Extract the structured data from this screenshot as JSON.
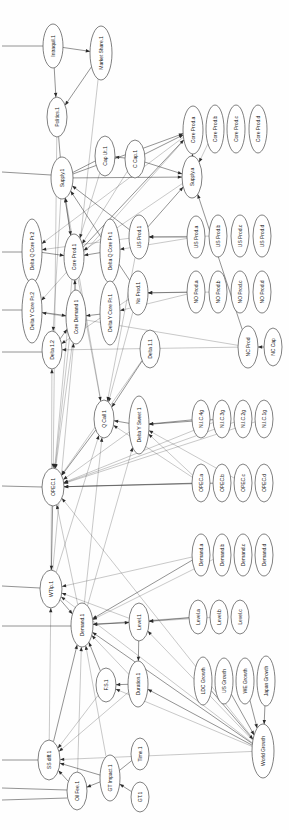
{
  "diagram": {
    "orientation": "rotated-90-ccw",
    "node_shape": "ellipse",
    "colors": {
      "node_fill": "#ffffff",
      "node_stroke": "#4a4a4a",
      "edge": "#3a3a3a",
      "label": "#1a1a1a",
      "background": "#ffffff"
    },
    "nodes": [
      {
        "id": "intraquil1",
        "label": "Intraquil.1",
        "x": 53,
        "y": 46,
        "rx": 10,
        "ry": 22
      },
      {
        "id": "marketshare1",
        "label": "Market Share.1",
        "x": 101,
        "y": 53,
        "rx": 11,
        "ry": 27
      },
      {
        "id": "politics1",
        "label": "Politics.1",
        "x": 57,
        "y": 117,
        "rx": 10,
        "ry": 20
      },
      {
        "id": "caput1",
        "label": "Cap Ut.1",
        "x": 105,
        "y": 156,
        "rx": 10,
        "ry": 20
      },
      {
        "id": "ccap1",
        "label": "C Cap.1",
        "x": 135,
        "y": 159,
        "rx": 10,
        "ry": 19
      },
      {
        "id": "supply1",
        "label": "Supply.1",
        "x": 62,
        "y": 178,
        "rx": 11,
        "ry": 21
      },
      {
        "id": "coreproda",
        "label": "Core Prod.a",
        "x": 193,
        "y": 130,
        "rx": 10,
        "ry": 24
      },
      {
        "id": "coreprodb",
        "label": "Core Prod.b",
        "x": 215,
        "y": 129,
        "rx": 9,
        "ry": 24
      },
      {
        "id": "coreprodc",
        "label": "Core Prod.c",
        "x": 236,
        "y": 129,
        "rx": 9,
        "ry": 24
      },
      {
        "id": "coreprodd",
        "label": "Core Prod.d",
        "x": 258,
        "y": 129,
        "rx": 9,
        "ry": 24
      },
      {
        "id": "supplya",
        "label": "Supply.a",
        "x": 192,
        "y": 177,
        "rx": 10,
        "ry": 21
      },
      {
        "id": "deltaqcorepr2",
        "label": "Delta Q Core Pr.2",
        "x": 32,
        "y": 251,
        "rx": 10,
        "ry": 32
      },
      {
        "id": "coreprod1",
        "label": "Core Prod.1",
        "x": 74,
        "y": 257,
        "rx": 10,
        "ry": 23
      },
      {
        "id": "deltaqcorepr1",
        "label": "Delta Q Core Pr.1",
        "x": 110,
        "y": 251,
        "rx": 10,
        "ry": 32
      },
      {
        "id": "usprod1",
        "label": "US Prod.1",
        "x": 139,
        "y": 237,
        "rx": 10,
        "ry": 22
      },
      {
        "id": "usproda",
        "label": "US Prod.a",
        "x": 196,
        "y": 237,
        "rx": 9,
        "ry": 21
      },
      {
        "id": "usprodb",
        "label": "US Prod.b",
        "x": 218,
        "y": 236,
        "rx": 9,
        "ry": 21
      },
      {
        "id": "usprodc",
        "label": "US Prod.c",
        "x": 240,
        "y": 236,
        "rx": 9,
        "ry": 21
      },
      {
        "id": "usprodd",
        "label": "US Prod.d",
        "x": 262,
        "y": 236,
        "rx": 9,
        "ry": 21
      },
      {
        "id": "deltaycorepr2",
        "label": "Delta Y Core Pr.2",
        "x": 32,
        "y": 311,
        "rx": 10,
        "ry": 32
      },
      {
        "id": "coredemand1",
        "label": "Core Demand 1",
        "x": 76,
        "y": 317,
        "rx": 10,
        "ry": 27
      },
      {
        "id": "deltaycorepr1",
        "label": "Delta Y Core Pr.1",
        "x": 110,
        "y": 313,
        "rx": 10,
        "ry": 32
      },
      {
        "id": "noprod1",
        "label": "No Prod.1",
        "x": 138,
        "y": 293,
        "rx": 10,
        "ry": 22
      },
      {
        "id": "noproda",
        "label": "NO Prod.a",
        "x": 196,
        "y": 292,
        "rx": 9,
        "ry": 21
      },
      {
        "id": "noprodb",
        "label": "NO Prod.b",
        "x": 218,
        "y": 292,
        "rx": 9,
        "ry": 21
      },
      {
        "id": "noprodc",
        "label": "NO Prod.c",
        "x": 240,
        "y": 292,
        "rx": 9,
        "ry": 21
      },
      {
        "id": "noprodd",
        "label": "NO Prod.d",
        "x": 262,
        "y": 292,
        "rx": 9,
        "ry": 21
      },
      {
        "id": "ncprod",
        "label": "NC Prod",
        "x": 248,
        "y": 347,
        "rx": 10,
        "ry": 21
      },
      {
        "id": "nccap",
        "label": "NC Cap",
        "x": 273,
        "y": 347,
        "rx": 9,
        "ry": 19
      },
      {
        "id": "delta12",
        "label": "Delta 1.2",
        "x": 52,
        "y": 350,
        "rx": 10,
        "ry": 19
      },
      {
        "id": "delta11",
        "label": "Delta 1.1",
        "x": 150,
        "y": 349,
        "rx": 10,
        "ry": 19
      },
      {
        "id": "qcall1",
        "label": "Q Call 1",
        "x": 104,
        "y": 419,
        "rx": 10,
        "ry": 19
      },
      {
        "id": "deltaysweet1",
        "label": "Delta Y Sweet 1",
        "x": 139,
        "y": 425,
        "rx": 10,
        "ry": 29
      },
      {
        "id": "nic4g",
        "label": "N.I.C.4g",
        "x": 201,
        "y": 419,
        "rx": 9,
        "ry": 19
      },
      {
        "id": "nic3g",
        "label": "N.I.C.3g",
        "x": 222,
        "y": 419,
        "rx": 9,
        "ry": 19
      },
      {
        "id": "nic2g",
        "label": "N.I.C.2g",
        "x": 243,
        "y": 419,
        "rx": 9,
        "ry": 19
      },
      {
        "id": "nic1g",
        "label": "N.I.C.1g",
        "x": 264,
        "y": 419,
        "rx": 9,
        "ry": 19
      },
      {
        "id": "opec1",
        "label": "OPEC.1",
        "x": 53,
        "y": 487,
        "rx": 11,
        "ry": 19
      },
      {
        "id": "opeca",
        "label": "OPEC.a",
        "x": 201,
        "y": 483,
        "rx": 9,
        "ry": 19
      },
      {
        "id": "opecb",
        "label": "OPEC.b",
        "x": 222,
        "y": 483,
        "rx": 9,
        "ry": 19
      },
      {
        "id": "opecc",
        "label": "OPEC.c",
        "x": 243,
        "y": 483,
        "rx": 9,
        "ry": 19
      },
      {
        "id": "opecd",
        "label": "OPEC.d",
        "x": 264,
        "y": 483,
        "rx": 9,
        "ry": 19
      },
      {
        "id": "demanda",
        "label": "Demand.a",
        "x": 201,
        "y": 555,
        "rx": 9,
        "ry": 21
      },
      {
        "id": "demandb",
        "label": "Demand.b",
        "x": 222,
        "y": 555,
        "rx": 9,
        "ry": 21
      },
      {
        "id": "demandc",
        "label": "Demand.c",
        "x": 243,
        "y": 555,
        "rx": 9,
        "ry": 21
      },
      {
        "id": "demandd",
        "label": "Demand.d",
        "x": 264,
        "y": 555,
        "rx": 9,
        "ry": 21
      },
      {
        "id": "wtip1",
        "label": "WTIp.1",
        "x": 51,
        "y": 589,
        "rx": 11,
        "ry": 19
      },
      {
        "id": "demand1",
        "label": "Demand.1",
        "x": 82,
        "y": 625,
        "rx": 11,
        "ry": 22
      },
      {
        "id": "level1",
        "label": "Level.1",
        "x": 139,
        "y": 622,
        "rx": 10,
        "ry": 19
      },
      {
        "id": "levela",
        "label": "Level.a",
        "x": 198,
        "y": 617,
        "rx": 9,
        "ry": 17
      },
      {
        "id": "levelb",
        "label": "Level.b",
        "x": 219,
        "y": 617,
        "rx": 9,
        "ry": 17
      },
      {
        "id": "levelc",
        "label": "Level.c",
        "x": 240,
        "y": 617,
        "rx": 9,
        "ry": 17
      },
      {
        "id": "fs1",
        "label": "F.S.1",
        "x": 106,
        "y": 685,
        "rx": 10,
        "ry": 17
      },
      {
        "id": "duration1",
        "label": "Duration.1",
        "x": 138,
        "y": 684,
        "rx": 10,
        "ry": 23
      },
      {
        "id": "ldcgrowth",
        "label": "LDC Growth",
        "x": 203,
        "y": 681,
        "rx": 9,
        "ry": 24
      },
      {
        "id": "usgrowth",
        "label": "US Growth",
        "x": 224,
        "y": 681,
        "rx": 9,
        "ry": 23
      },
      {
        "id": "wegrowth",
        "label": "WE Growth",
        "x": 245,
        "y": 681,
        "rx": 9,
        "ry": 23
      },
      {
        "id": "japangrowth",
        "label": "Japan Growth",
        "x": 266,
        "y": 681,
        "rx": 9,
        "ry": 25
      },
      {
        "id": "worldgrowth",
        "label": "World Growth",
        "x": 263,
        "y": 751,
        "rx": 11,
        "ry": 27
      },
      {
        "id": "ssdiff1",
        "label": "SS diff.1",
        "x": 49,
        "y": 760,
        "rx": 11,
        "ry": 20
      },
      {
        "id": "oilfee1",
        "label": "Oil Fee.1",
        "x": 77,
        "y": 791,
        "rx": 10,
        "ry": 19
      },
      {
        "id": "gtimpact1",
        "label": "GT Impact.1",
        "x": 110,
        "y": 778,
        "rx": 10,
        "ry": 23
      },
      {
        "id": "gt1",
        "label": "GT.1",
        "x": 140,
        "y": 797,
        "rx": 9,
        "ry": 15
      },
      {
        "id": "time1",
        "label": "Time.1",
        "x": 140,
        "y": 754,
        "rx": 9,
        "ry": 16
      }
    ],
    "edges": [
      {
        "from": "intraquil1",
        "to": "marketshare1",
        "arrow": true
      },
      {
        "from": "intraquil1",
        "to": "politics1",
        "arrow": true
      },
      {
        "from": "marketshare1",
        "to": "politics1",
        "arrow": true
      },
      {
        "from": "politics1",
        "to": "supply1",
        "arrow": false
      },
      {
        "from": "ccap1",
        "to": "caput1",
        "arrow": true
      },
      {
        "from": "caput1",
        "to": "supply1",
        "arrow": false
      },
      {
        "from": "supply1",
        "to": "coreproda",
        "arrow": true
      },
      {
        "from": "supply1",
        "to": "supplya",
        "arrow": true
      },
      {
        "from": "ccap1",
        "to": "coreproda",
        "arrow": true
      },
      {
        "from": "ccap1",
        "to": "supplya",
        "arrow": true
      },
      {
        "from": "supplya",
        "to": "coreproda",
        "arrow": true
      },
      {
        "from": "coreprod1",
        "to": "supply1",
        "arrow": true
      },
      {
        "from": "coreprod1",
        "to": "coreproda",
        "arrow": true
      },
      {
        "from": "usprod1",
        "to": "supply1",
        "arrow": true
      },
      {
        "from": "usprod1",
        "to": "supplya",
        "arrow": true
      },
      {
        "from": "usproda",
        "to": "usprod1",
        "arrow": true
      },
      {
        "from": "noprod1",
        "to": "supply1",
        "arrow": true
      },
      {
        "from": "noproda",
        "to": "noprod1",
        "arrow": true
      },
      {
        "from": "ncprod",
        "to": "supplya",
        "arrow": true
      },
      {
        "from": "nccap",
        "to": "ncprod",
        "arrow": true
      },
      {
        "from": "deltaqcorepr2",
        "to": "coreprod1",
        "arrow": true
      },
      {
        "from": "deltaqcorepr1",
        "to": "coreprod1",
        "arrow": true
      },
      {
        "from": "deltaycorepr2",
        "to": "coredemand1",
        "arrow": true
      },
      {
        "from": "deltaycorepr1",
        "to": "coredemand1",
        "arrow": true
      },
      {
        "from": "coredemand1",
        "to": "coreprod1",
        "arrow": true
      },
      {
        "from": "delta12",
        "to": "coredemand1",
        "arrow": true
      },
      {
        "from": "delta11",
        "to": "qcall1",
        "arrow": true
      },
      {
        "from": "qcall1",
        "to": "opec1",
        "arrow": true
      },
      {
        "from": "deltaysweet1",
        "to": "qcall1",
        "arrow": true
      },
      {
        "from": "nic4g",
        "to": "deltaysweet1",
        "arrow": true
      },
      {
        "from": "nic3g",
        "to": "deltaysweet1",
        "arrow": true
      },
      {
        "from": "opeca",
        "to": "opec1",
        "arrow": true
      },
      {
        "from": "opecb",
        "to": "opec1",
        "arrow": true
      },
      {
        "from": "opec1",
        "to": "wtip1",
        "arrow": true
      },
      {
        "from": "wtip1",
        "to": "demand1",
        "arrow": true
      },
      {
        "from": "demanda",
        "to": "demand1",
        "arrow": true
      },
      {
        "from": "demand1",
        "to": "level1",
        "arrow": true
      },
      {
        "from": "levela",
        "to": "level1",
        "arrow": true
      },
      {
        "from": "level1",
        "to": "duration1",
        "arrow": true
      },
      {
        "from": "duration1",
        "to": "fs1",
        "arrow": true
      },
      {
        "from": "fs1",
        "to": "demand1",
        "arrow": true
      },
      {
        "from": "ldcgrowth",
        "to": "worldgrowth",
        "arrow": true
      },
      {
        "from": "usgrowth",
        "to": "worldgrowth",
        "arrow": true
      },
      {
        "from": "wegrowth",
        "to": "worldgrowth",
        "arrow": true
      },
      {
        "from": "japangrowth",
        "to": "worldgrowth",
        "arrow": true
      },
      {
        "from": "worldgrowth",
        "to": "duration1",
        "arrow": true
      },
      {
        "from": "worldgrowth",
        "to": "demand1",
        "arrow": true
      },
      {
        "from": "ssdiff1",
        "to": "demand1",
        "arrow": true
      },
      {
        "from": "gtimpact1",
        "to": "oilfee1",
        "arrow": true
      },
      {
        "from": "gt1",
        "to": "gtimpact1",
        "arrow": true
      },
      {
        "from": "time1",
        "to": "gtimpact1",
        "arrow": false
      },
      {
        "from": "gtimpact1",
        "to": "ssdiff1",
        "arrow": true
      },
      {
        "from": "oilfee1",
        "to": "ssdiff1",
        "arrow": true
      }
    ],
    "long_edges": [
      {
        "from": "coreproda",
        "to": "deltaqcorepr2"
      },
      {
        "from": "coreproda",
        "to": "deltaycorepr2"
      },
      {
        "from": "supplya",
        "to": "coreprod1"
      },
      {
        "from": "usproda",
        "to": "deltaqcorepr1"
      },
      {
        "from": "noproda",
        "to": "deltaycorepr1"
      },
      {
        "from": "ncprod",
        "to": "deltaycorepr2"
      },
      {
        "from": "ncprod",
        "to": "delta12"
      },
      {
        "from": "opeca",
        "to": "deltaysweet1"
      },
      {
        "from": "opeca",
        "to": "qcall1"
      },
      {
        "from": "demanda",
        "to": "wtip1"
      },
      {
        "from": "levela",
        "to": "demand1"
      },
      {
        "from": "worldgrowth",
        "to": "opec1"
      },
      {
        "from": "worldgrowth",
        "to": "level1"
      },
      {
        "from": "worldgrowth",
        "to": "wtip1"
      },
      {
        "from": "worldgrowth",
        "to": "fs1"
      },
      {
        "from": "worldgrowth",
        "to": "ssdiff1"
      },
      {
        "from": "nic1g",
        "to": "opec1"
      },
      {
        "from": "nic2g",
        "to": "opec1"
      },
      {
        "from": "usprod1",
        "to": "deltaqcorepr2"
      },
      {
        "from": "noprod1",
        "to": "delta12"
      },
      {
        "from": "delta11",
        "to": "opec1"
      },
      {
        "from": "qcall1",
        "to": "supply1"
      },
      {
        "from": "coredemand1",
        "to": "opec1"
      },
      {
        "from": "demand1",
        "to": "opec1"
      },
      {
        "from": "level1",
        "to": "wtip1"
      },
      {
        "from": "duration1",
        "to": "demand1"
      },
      {
        "from": "ssdiff1",
        "to": "wtip1"
      },
      {
        "from": "deltaysweet1",
        "to": "opec1"
      },
      {
        "from": "coreprod1",
        "to": "qcall1"
      },
      {
        "from": "coreprod1",
        "to": "opec1"
      },
      {
        "from": "usprod1",
        "to": "qcall1"
      },
      {
        "from": "noprod1",
        "to": "qcall1"
      },
      {
        "from": "caput1",
        "to": "coreprod1"
      },
      {
        "from": "ccap1",
        "to": "coreprod1"
      },
      {
        "from": "supply1",
        "to": "delta12"
      },
      {
        "from": "supply1",
        "to": "coreprod1"
      },
      {
        "from": "politics1",
        "to": "opec1"
      },
      {
        "from": "marketshare1",
        "to": "opec1"
      },
      {
        "from": "demand1",
        "to": "qcall1"
      },
      {
        "from": "demand1",
        "to": "deltaysweet1"
      },
      {
        "from": "wtip1",
        "to": "coredemand1"
      },
      {
        "from": "wtip1",
        "to": "delta12"
      },
      {
        "from": "wtip1",
        "to": "qcall1"
      },
      {
        "from": "fs1",
        "to": "ssdiff1"
      },
      {
        "from": "duration1",
        "to": "ssdiff1"
      },
      {
        "from": "gtimpact1",
        "to": "demand1"
      },
      {
        "from": "oilfee1",
        "to": "demand1"
      },
      {
        "from": "level1",
        "to": "demand1"
      },
      {
        "from": "nic3g",
        "to": "opec1"
      },
      {
        "from": "opecc",
        "to": "deltaysweet1"
      },
      {
        "from": "demandb",
        "to": "demand1"
      },
      {
        "from": "levelb",
        "to": "level1"
      },
      {
        "from": "coreprodb",
        "to": "supplya"
      },
      {
        "from": "usprodb",
        "to": "usprod1"
      },
      {
        "from": "noprodb",
        "to": "noprod1"
      }
    ],
    "stub_edges": [
      {
        "x1": 2,
        "y1": 46,
        "x2": 43,
        "y2": 46
      },
      {
        "x1": 2,
        "y1": 172,
        "x2": 51,
        "y2": 175
      },
      {
        "x1": 2,
        "y1": 252,
        "x2": 22,
        "y2": 252
      },
      {
        "x1": 2,
        "y1": 310,
        "x2": 22,
        "y2": 310
      },
      {
        "x1": 2,
        "y1": 352,
        "x2": 42,
        "y2": 352
      },
      {
        "x1": 2,
        "y1": 486,
        "x2": 42,
        "y2": 487
      },
      {
        "x1": 2,
        "y1": 586,
        "x2": 40,
        "y2": 588
      },
      {
        "x1": 2,
        "y1": 626,
        "x2": 71,
        "y2": 626
      },
      {
        "x1": 2,
        "y1": 760,
        "x2": 38,
        "y2": 760
      },
      {
        "x1": 2,
        "y1": 788,
        "x2": 67,
        "y2": 790
      },
      {
        "x1": 2,
        "y1": 800,
        "x2": 67,
        "y2": 798
      }
    ]
  }
}
